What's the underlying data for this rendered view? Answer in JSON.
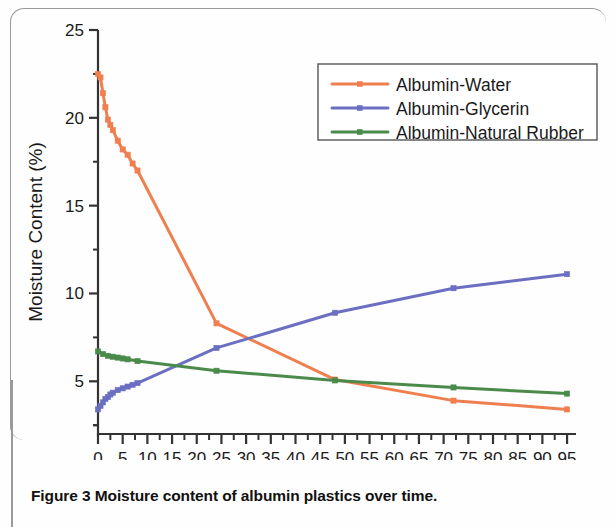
{
  "caption": {
    "number": "Figure 3",
    "text": "Moisture content of albumin plastics over time."
  },
  "chart_data": {
    "type": "line",
    "title": "",
    "xlabel": "Time (Hours)",
    "ylabel": "Moisture Content (%)",
    "xlim": [
      0,
      96
    ],
    "ylim": [
      0,
      25
    ],
    "xticks": [
      0,
      5,
      10,
      15,
      20,
      25,
      30,
      35,
      40,
      45,
      50,
      55,
      60,
      65,
      70,
      75,
      80,
      85,
      90,
      95
    ],
    "xtick_labels": [
      "0",
      "5",
      "10",
      "15",
      "20",
      "25",
      "30",
      "35",
      "40",
      "45",
      "50",
      "55",
      "60",
      "65",
      "70",
      "75",
      "80",
      "85",
      "90",
      "95"
    ],
    "yticks": [
      5,
      10,
      15,
      20,
      25
    ],
    "ytick_labels": [
      "5",
      "10",
      "15",
      "20",
      "25"
    ],
    "y_minor_ticks": [
      2.5,
      7.5,
      12.5,
      17.5,
      22.5
    ],
    "grid": false,
    "legend_position": "top-right",
    "series": [
      {
        "name": "Albumin-Water",
        "color": "#F07F50",
        "marker": "square",
        "x": [
          0,
          0.5,
          1,
          1.5,
          2,
          2.5,
          3,
          4,
          5,
          6,
          7,
          8,
          24,
          48,
          72,
          95
        ],
        "values": [
          22.5,
          22.3,
          21.4,
          20.6,
          19.9,
          19.6,
          19.3,
          18.7,
          18.2,
          17.9,
          17.4,
          17.0,
          8.3,
          5.1,
          3.9,
          3.4
        ]
      },
      {
        "name": "Albumin-Glycerin",
        "color": "#6B6FC2",
        "marker": "square",
        "x": [
          0,
          0.5,
          1,
          1.5,
          2,
          2.5,
          3,
          4,
          5,
          6,
          7,
          8,
          24,
          48,
          72,
          95
        ],
        "values": [
          3.4,
          3.6,
          3.8,
          4.0,
          4.1,
          4.25,
          4.35,
          4.5,
          4.6,
          4.7,
          4.8,
          4.9,
          6.9,
          8.9,
          10.3,
          11.1
        ]
      },
      {
        "name": "Albumin-Natural Rubber",
        "color": "#4A8B4C",
        "marker": "square",
        "x": [
          0,
          1,
          2,
          3,
          4,
          5,
          6,
          8,
          24,
          48,
          72,
          95
        ],
        "values": [
          6.7,
          6.55,
          6.45,
          6.4,
          6.35,
          6.3,
          6.25,
          6.15,
          5.6,
          5.05,
          4.65,
          4.3
        ]
      }
    ]
  },
  "legend": {
    "entries": [
      {
        "label": "Albumin-Water",
        "color": "#F07F50"
      },
      {
        "label": "Albumin-Glycerin",
        "color": "#6B6FC2"
      },
      {
        "label": "Albumin-Natural Rubber",
        "color": "#4A8B4C"
      }
    ]
  }
}
